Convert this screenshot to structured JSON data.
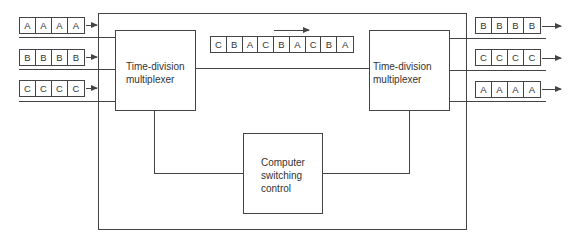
{
  "diagram": {
    "type": "time-division switching system",
    "left_mux": {
      "label": "Time-division\nmultiplexer",
      "line1": "Time-division",
      "line2": "multiplexer"
    },
    "right_mux": {
      "label": "Time-division\nmultiplexer",
      "line1": "Time-division",
      "line2": "multiplexer"
    },
    "control": {
      "line1": "Computer",
      "line2": "switching",
      "line3": "control"
    },
    "inputs": [
      {
        "channel": "A",
        "cells": [
          "A",
          "A",
          "A",
          "A"
        ]
      },
      {
        "channel": "B",
        "cells": [
          "B",
          "B",
          "B",
          "B"
        ]
      },
      {
        "channel": "C",
        "cells": [
          "C",
          "C",
          "C",
          "C"
        ]
      }
    ],
    "stream": {
      "cells": [
        "C",
        "B",
        "A",
        "C",
        "B",
        "A",
        "C",
        "B",
        "A"
      ],
      "direction": "right"
    },
    "outputs": [
      {
        "channel": "B",
        "cells": [
          "B",
          "B",
          "B",
          "B"
        ]
      },
      {
        "channel": "C",
        "cells": [
          "C",
          "C",
          "C",
          "C"
        ]
      },
      {
        "channel": "A",
        "cells": [
          "A",
          "A",
          "A",
          "A"
        ]
      }
    ],
    "colors": {
      "line": "#444444",
      "background": "#ffffff",
      "text": "#333333"
    }
  }
}
